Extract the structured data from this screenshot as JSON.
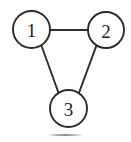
{
  "figure": {
    "type": "undirected-graph-diagram",
    "width": 131,
    "height": 142,
    "background_color": "#ffffff",
    "stroke_color": "#2b2b2d",
    "label_color": "#1d1d1f"
  },
  "graph": {
    "nodes": [
      {
        "id": "1",
        "label": "1",
        "cx": 31.5,
        "cy": 29.5,
        "r": 18.5,
        "position": "top-left"
      },
      {
        "id": "2",
        "label": "2",
        "cx": 106.0,
        "cy": 30.0,
        "r": 18.0,
        "position": "top-right"
      },
      {
        "id": "3",
        "label": "3",
        "cx": 68.5,
        "cy": 108.5,
        "r": 18.5,
        "position": "bottom-center"
      }
    ],
    "edges": [
      {
        "from": "1",
        "to": "2",
        "orientation": "horizontal",
        "x1": 50.0,
        "y1": 30.0,
        "x2": 88.0,
        "y2": 30.0
      },
      {
        "from": "1",
        "to": "3",
        "orientation": "diagonal",
        "x1": 41.5,
        "y1": 45.8,
        "x2": 58.6,
        "y2": 93.0
      },
      {
        "from": "2",
        "to": "3",
        "orientation": "diagonal",
        "x1": 96.5,
        "y1": 45.3,
        "x2": 78.8,
        "y2": 93.4
      }
    ],
    "edge_count": 3,
    "node_count": 3
  },
  "artifacts": {
    "bottom_smudge": {
      "description": "faint gray scan smudge near bottom center",
      "color": "#8a8a8d"
    }
  }
}
